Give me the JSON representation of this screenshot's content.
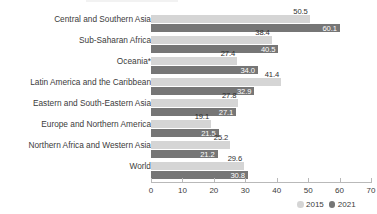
{
  "chart_data": {
    "type": "bar",
    "orientation": "horizontal",
    "title": "",
    "subtitle": "",
    "xlabel": "",
    "ylabel": "",
    "xlim": [
      0,
      70
    ],
    "xticks": [
      0,
      10,
      20,
      30,
      40,
      50,
      60,
      70
    ],
    "grid": false,
    "legend_position": "bottom-right",
    "categories": [
      "Central and Southern Asia",
      "Sub-Saharan Africa",
      "Oceania*",
      "Latin America and the Caribbean",
      "Eastern and South-Eastern Asia",
      "Europe and Northern America",
      "Northern Africa and Western Asia",
      "World"
    ],
    "series": [
      {
        "name": "2015",
        "color": "#d5d5d5",
        "values": [
          50.5,
          38.4,
          27.4,
          41.4,
          27.8,
          19.1,
          25.2,
          29.6
        ]
      },
      {
        "name": "2021",
        "color": "#767676",
        "values": [
          60.1,
          40.5,
          34.0,
          32.9,
          27.1,
          21.5,
          21.2,
          30.8
        ]
      }
    ]
  },
  "legend": {
    "items": [
      {
        "label": "2015",
        "marker": "circle-light"
      },
      {
        "label": "2021",
        "marker": "circle-dark"
      }
    ]
  },
  "axis": {
    "tick_labels": [
      "0",
      "10",
      "20",
      "30",
      "40",
      "50",
      "60",
      "70"
    ]
  },
  "colors": {
    "series_2015": "#d5d5d5",
    "series_2021": "#767676",
    "axis": "#b9b9b9",
    "text": "#3b3b3b",
    "value_label_dark": "#2f2f2f",
    "value_label_light": "#ffffff",
    "background": "#ffffff"
  }
}
